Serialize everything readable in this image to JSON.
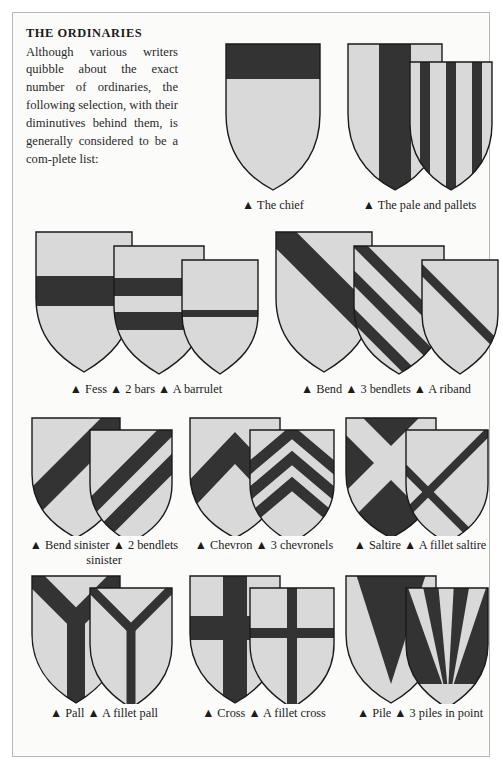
{
  "page": {
    "background_color": "#fbfbfa",
    "border_color": "#b9b7b4",
    "field_color": "#d9d9d9",
    "charge_color": "#333333",
    "outline_color": "#1a1a1a"
  },
  "intro": {
    "title": "THE ORDINARIES",
    "body": "Although various writers quibble about the exact number of ordinaries, the following selection, with their diminutives behind them, is generally considered to be a com-plete list:"
  },
  "figures": [
    {
      "id": "chief",
      "caption": "▲ The chief",
      "shields": [
        {
          "name": "shield-chief",
          "ordinary": "chief"
        }
      ]
    },
    {
      "id": "pale",
      "caption": "▲ The pale and pallets",
      "shields": [
        {
          "name": "shield-pale",
          "ordinary": "pale"
        },
        {
          "name": "shield-pallets",
          "ordinary": "pallets",
          "count": 3
        }
      ]
    },
    {
      "id": "fess",
      "caption": "▲ Fess ▲ 2 bars ▲ A barrulet",
      "shields": [
        {
          "name": "shield-fess",
          "ordinary": "fess"
        },
        {
          "name": "shield-bars",
          "ordinary": "bars",
          "count": 2
        },
        {
          "name": "shield-barrulet",
          "ordinary": "barrulet"
        }
      ]
    },
    {
      "id": "bend",
      "caption": "▲ Bend ▲ 3 bendlets ▲ A riband",
      "shields": [
        {
          "name": "shield-bend",
          "ordinary": "bend"
        },
        {
          "name": "shield-bendlets",
          "ordinary": "bendlets",
          "count": 3
        },
        {
          "name": "shield-riband",
          "ordinary": "riband"
        }
      ]
    },
    {
      "id": "bend-sinister",
      "caption": "▲ Bend sinister ▲ 2 bendlets sinister",
      "shields": [
        {
          "name": "shield-bend-sinister",
          "ordinary": "bend-sinister"
        },
        {
          "name": "shield-bendlets-sinister",
          "ordinary": "bendlets-sinister",
          "count": 2
        }
      ]
    },
    {
      "id": "chevron",
      "caption": "▲ Chevron ▲ 3 chevronels",
      "shields": [
        {
          "name": "shield-chevron",
          "ordinary": "chevron"
        },
        {
          "name": "shield-chevronels",
          "ordinary": "chevronels",
          "count": 3
        }
      ]
    },
    {
      "id": "saltire",
      "caption": "▲ Saltire ▲ A fillet saltire",
      "shields": [
        {
          "name": "shield-saltire",
          "ordinary": "saltire"
        },
        {
          "name": "shield-fillet-saltire",
          "ordinary": "fillet-saltire"
        }
      ]
    },
    {
      "id": "pall",
      "caption": "▲ Pall ▲ A fillet pall",
      "shields": [
        {
          "name": "shield-pall",
          "ordinary": "pall"
        },
        {
          "name": "shield-fillet-pall",
          "ordinary": "fillet-pall"
        }
      ]
    },
    {
      "id": "cross",
      "caption": "▲ Cross ▲ A fillet cross",
      "shields": [
        {
          "name": "shield-cross",
          "ordinary": "cross"
        },
        {
          "name": "shield-fillet-cross",
          "ordinary": "fillet-cross"
        }
      ]
    },
    {
      "id": "pile",
      "caption": "▲ Pile ▲ 3 piles in point",
      "shields": [
        {
          "name": "shield-pile",
          "ordinary": "pile"
        },
        {
          "name": "shield-piles-in-point",
          "ordinary": "piles-in-point",
          "count": 3
        }
      ]
    }
  ],
  "captions": {
    "chief": "▲ The chief",
    "pale": "▲ The pale and pallets",
    "fess": "▲ Fess ▲ 2 bars ▲ A barrulet",
    "bend": "▲ Bend ▲ 3 bendlets ▲ A riband",
    "bend_sinister": "▲ Bend sinister ▲ 2 bendlets sinister",
    "chevron": "▲ Chevron ▲ 3 chevronels",
    "saltire": "▲ Saltire ▲ A fillet saltire",
    "pall": "▲ Pall ▲ A fillet pall",
    "cross": "▲ Cross ▲ A fillet cross",
    "pile": "▲ Pile ▲ 3 piles in point"
  }
}
